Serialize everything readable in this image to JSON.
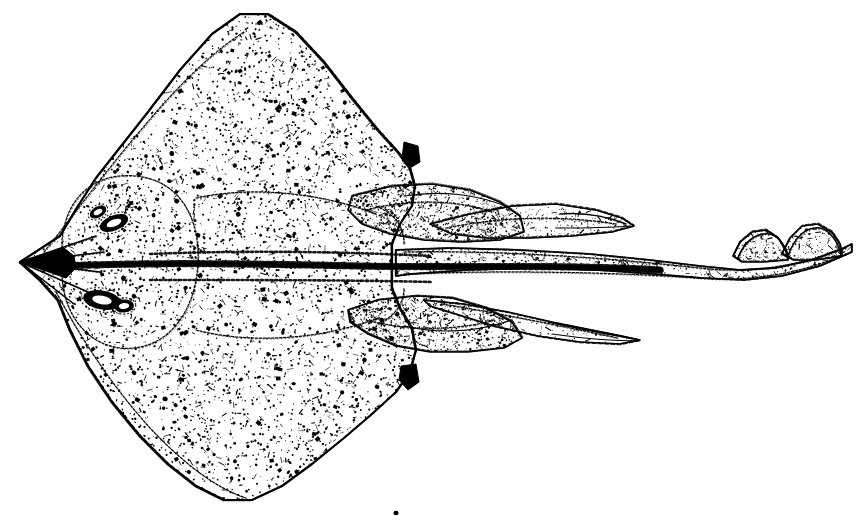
{
  "figure": {
    "type": "scientific-illustration",
    "medium": "stippled pen-and-ink line drawing",
    "orientation": "head to the left, tail to the right",
    "background_color": "#ffffff",
    "ink_color": "#000000",
    "caption": "",
    "width": 862,
    "height": 529
  },
  "anatomy": {
    "parts": [
      {
        "name": "pectoral-disc",
        "label": "Pectoral disc",
        "description": "Broad rhomboid disc formed by fused pectoral fins, densely stippled with scattered dark dermal denticles",
        "bbox": [
          28,
          12,
          430,
          500
        ]
      },
      {
        "name": "rostrum",
        "label": "Rostrum / snout",
        "description": "Sharply pointed anterior snout tip with radiating rostral cartilage lines",
        "bbox": [
          18,
          240,
          90,
          290
        ]
      },
      {
        "name": "left-eye",
        "label": "Eye",
        "description": "Dark elliptical eye on dorsal surface",
        "bbox": [
          96,
          212,
          132,
          234
        ]
      },
      {
        "name": "left-spiracle",
        "label": "Spiracle",
        "description": "Dark elliptical spiracle posterior to the eye",
        "bbox": [
          82,
          288,
          124,
          312
        ]
      },
      {
        "name": "anterior-wing-lobe",
        "label": "Anterior pectoral lobe",
        "description": "Upper leading edge of the disc rising to a rounded apex",
        "bbox": [
          80,
          12,
          420,
          210
        ]
      },
      {
        "name": "posterior-wing-lobe",
        "label": "Posterior pectoral lobe",
        "description": "Lower trailing portion of the disc",
        "bbox": [
          60,
          300,
          420,
          500
        ]
      },
      {
        "name": "pelvic-fin-upper",
        "label": "Pelvic fin (upper)",
        "description": "Lobed pelvic fin projecting posteriorly above the tail",
        "bbox": [
          360,
          185,
          530,
          250
        ]
      },
      {
        "name": "pelvic-fin-lower",
        "label": "Pelvic fin (lower)",
        "description": "Lobed pelvic fin projecting posteriorly below the tail",
        "bbox": [
          360,
          290,
          530,
          355
        ]
      },
      {
        "name": "clasper-upper",
        "label": "Clasper (upper)",
        "description": "Elongate tapering male clasper extending back and up",
        "bbox": [
          430,
          200,
          635,
          245
        ]
      },
      {
        "name": "clasper-lower",
        "label": "Clasper (lower)",
        "description": "Elongate tapering male clasper extending back and down",
        "bbox": [
          430,
          288,
          645,
          340
        ]
      },
      {
        "name": "tail",
        "label": "Tail",
        "description": "Long slender tail with a dark median row of thorns, tapering and curving upward distally",
        "bbox": [
          400,
          240,
          850,
          300
        ]
      },
      {
        "name": "first-dorsal-fin",
        "label": "First dorsal fin",
        "description": "Small dorsal fin near the tail tip",
        "bbox": [
          733,
          232,
          790,
          262
        ]
      },
      {
        "name": "second-dorsal-fin",
        "label": "Second dorsal fin",
        "description": "Small dorsal fin just behind the first, at the tail tip",
        "bbox": [
          780,
          224,
          840,
          258
        ]
      },
      {
        "name": "median-thorn-row",
        "label": "Median thorn row",
        "description": "Dense dark line of median thorns running the length of the midline from disc to tail",
        "bbox": [
          60,
          258,
          700,
          276
        ]
      },
      {
        "name": "notch-right-upper",
        "label": "Disc posterior notch (upper)",
        "description": "Small dark notch on the posterior right edge of the upper disc",
        "bbox": [
          404,
          140,
          420,
          168
        ]
      },
      {
        "name": "notch-right-lower",
        "label": "Disc posterior notch (lower)",
        "description": "Small dark notch on the posterior right edge of the lower disc",
        "bbox": [
          400,
          362,
          418,
          392
        ]
      },
      {
        "name": "stray-speck",
        "label": "Stray ink speck",
        "description": "Small isolated ink speck below the disc",
        "bbox": [
          393,
          510,
          399,
          516
        ]
      }
    ]
  },
  "texture": {
    "stipple_seed": 20240517,
    "dot_count_disc": 5200,
    "dot_count_tail": 900,
    "dot_min_radius": 0.45,
    "dot_max_radius": 2.4,
    "outline_stroke_width": 2.2
  }
}
